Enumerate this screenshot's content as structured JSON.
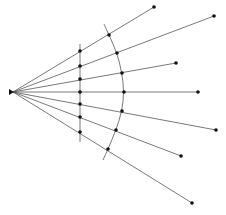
{
  "diagram": {
    "type": "ray-diagram",
    "colors": {
      "line": "#555555",
      "dot": "#111111",
      "background": "#ffffff"
    },
    "source": {
      "x": 13,
      "y": 92,
      "icon": "source-emitter-icon"
    },
    "rays": [
      {
        "end": [
          154,
          7
        ]
      },
      {
        "end": [
          214,
          16
        ]
      },
      {
        "end": [
          176,
          63
        ]
      },
      {
        "end": [
          198,
          92
        ]
      },
      {
        "end": [
          216,
          130
        ]
      },
      {
        "end": [
          181,
          156
        ]
      },
      {
        "end": [
          192,
          203
        ]
      }
    ],
    "plane_line": {
      "x": 80,
      "y1": 44,
      "y2": 142,
      "dots_y": [
        51,
        66,
        79,
        92,
        104,
        117,
        132
      ]
    },
    "wavefront_arc": {
      "path_points": [
        [
          104,
          24
        ],
        [
          109,
          35
        ],
        [
          117,
          53
        ],
        [
          122,
          73
        ],
        [
          124,
          92
        ],
        [
          122,
          111
        ],
        [
          116,
          130
        ],
        [
          108,
          149
        ],
        [
          103,
          160
        ]
      ],
      "dots": [
        [
          109,
          35
        ],
        [
          117,
          53
        ],
        [
          122,
          73
        ],
        [
          124,
          92
        ],
        [
          122,
          111
        ],
        [
          116,
          130
        ],
        [
          108,
          149
        ]
      ]
    },
    "caption": ""
  }
}
